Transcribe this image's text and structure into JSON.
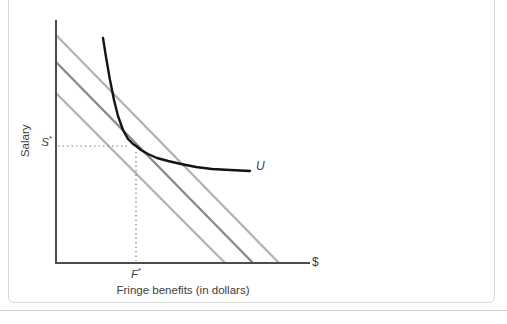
{
  "panel": {
    "border_color": "#d8d8d8"
  },
  "chart_data": {
    "type": "line",
    "title": "",
    "xlabel": "Fringe benefits (in dollars)",
    "ylabel": "Salary",
    "x_axis_end_label": "$",
    "legend": "none",
    "grid": false,
    "annotations": {
      "s_star": {
        "base": "S",
        "sup": "*"
      },
      "f_star": {
        "base": "F",
        "sup": "*"
      },
      "curve_label": "U"
    },
    "axes": {
      "origin": [
        56,
        263
      ],
      "y_axis_top": 20,
      "x_axis_right": 310,
      "color": "#4d4d4d",
      "width": 2
    },
    "series": [
      {
        "name": "isoprofit-line-upper",
        "color": "#b3b3b3",
        "width": 2.4,
        "from": [
          56,
          35
        ],
        "to": [
          279,
          263
        ]
      },
      {
        "name": "isoprofit-line-middle",
        "color": "#8a8a8a",
        "width": 2.4,
        "from": [
          56,
          62
        ],
        "to": [
          253,
          263
        ]
      },
      {
        "name": "isoprofit-line-lower",
        "color": "#b3b3b3",
        "width": 2.4,
        "from": [
          56,
          93
        ],
        "to": [
          225,
          263
        ]
      }
    ],
    "indifference_curve": {
      "name": "U",
      "color": "#141414",
      "width": 2.4,
      "points": [
        [
          103,
          38
        ],
        [
          106,
          57
        ],
        [
          110,
          80
        ],
        [
          114,
          100
        ],
        [
          118,
          116
        ],
        [
          123,
          130
        ],
        [
          128,
          139
        ],
        [
          133,
          144
        ],
        [
          136,
          146
        ],
        [
          141,
          150
        ],
        [
          148,
          154
        ],
        [
          157,
          158
        ],
        [
          168,
          161
        ],
        [
          181,
          164
        ],
        [
          196,
          167
        ],
        [
          212,
          169
        ],
        [
          230,
          170
        ],
        [
          250,
          171
        ]
      ]
    },
    "optimum": {
      "x": 136,
      "y": 146,
      "dotted_color": "#7f7f7f"
    }
  }
}
